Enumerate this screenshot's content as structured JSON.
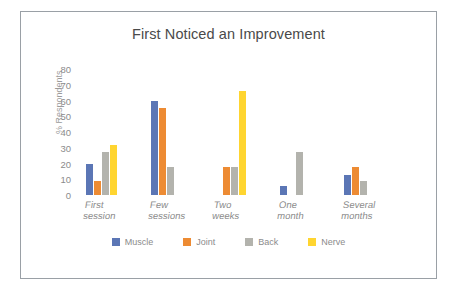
{
  "chart_data": {
    "type": "bar",
    "title": "First Noticed an Improvement",
    "xlabel": "",
    "ylabel": "% Respondents",
    "ylim": [
      0,
      80
    ],
    "yticks": [
      0,
      10,
      20,
      30,
      40,
      50,
      60,
      70,
      80
    ],
    "grid": false,
    "legend_position": "bottom",
    "categories": [
      "First session",
      "Few\nsessions",
      "Two weeks",
      "One month",
      "Several\nmonths"
    ],
    "series": [
      {
        "name": "Muscle",
        "color": "#5b76b5",
        "values": [
          20,
          60,
          0,
          6,
          13
        ]
      },
      {
        "name": "Joint",
        "color": "#ed8b33",
        "values": [
          9,
          55,
          18,
          0,
          18
        ]
      },
      {
        "name": "Back",
        "color": "#b3b3ad",
        "values": [
          27,
          18,
          18,
          27,
          9
        ]
      },
      {
        "name": "Nerve",
        "color": "#ffd530",
        "values": [
          32,
          0,
          66,
          0,
          0
        ]
      }
    ]
  },
  "colors": {
    "frame_border": "#9aa0a6",
    "title_text": "#4a4a4a",
    "tick_text": "#8b8b8b",
    "background": "#ffffff"
  }
}
